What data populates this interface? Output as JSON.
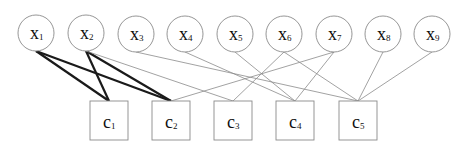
{
  "diagram": {
    "variables": [
      {
        "id": "x1",
        "label": "x",
        "sub": "1",
        "cx": 36,
        "cy": 33
      },
      {
        "id": "x2",
        "label": "x",
        "sub": "2",
        "cx": 86,
        "cy": 33
      },
      {
        "id": "x3",
        "label": "x",
        "sub": "3",
        "cx": 136,
        "cy": 34
      },
      {
        "id": "x4",
        "label": "x",
        "sub": "4",
        "cx": 185,
        "cy": 34
      },
      {
        "id": "x5",
        "label": "x",
        "sub": "5",
        "cx": 235,
        "cy": 34
      },
      {
        "id": "x6",
        "label": "x",
        "sub": "6",
        "cx": 284,
        "cy": 34
      },
      {
        "id": "x7",
        "label": "x",
        "sub": "7",
        "cx": 334,
        "cy": 34
      },
      {
        "id": "x8",
        "label": "x",
        "sub": "8",
        "cx": 383,
        "cy": 34
      },
      {
        "id": "x9",
        "label": "x",
        "sub": "9",
        "cx": 432,
        "cy": 34
      }
    ],
    "checks": [
      {
        "id": "c1",
        "label": "c",
        "sub": "1",
        "x": 90,
        "y": 101,
        "w": 38,
        "h": 39
      },
      {
        "id": "c2",
        "label": "c",
        "sub": "2",
        "x": 152,
        "y": 101,
        "w": 38,
        "h": 39
      },
      {
        "id": "c3",
        "label": "c",
        "sub": "3",
        "x": 214,
        "y": 101,
        "w": 38,
        "h": 39
      },
      {
        "id": "c4",
        "label": "c",
        "sub": "4",
        "x": 276,
        "y": 101,
        "w": 38,
        "h": 39
      },
      {
        "id": "c5",
        "label": "c",
        "sub": "5",
        "x": 339,
        "y": 101,
        "w": 38,
        "h": 39
      }
    ],
    "edges": [
      {
        "from": "x1",
        "to": "c1",
        "bold": true
      },
      {
        "from": "x1",
        "to": "c2",
        "bold": true
      },
      {
        "from": "x2",
        "to": "c1",
        "bold": true
      },
      {
        "from": "x2",
        "to": "c2",
        "bold": true
      },
      {
        "from": "x2",
        "to": "c3",
        "bold": false
      },
      {
        "from": "x3",
        "to": "c5",
        "bold": false
      },
      {
        "from": "x4",
        "to": "c4",
        "bold": false
      },
      {
        "from": "x5",
        "to": "c4",
        "bold": false
      },
      {
        "from": "x6",
        "to": "c3",
        "bold": false
      },
      {
        "from": "x6",
        "to": "c5",
        "bold": false
      },
      {
        "from": "x7",
        "to": "c2",
        "bold": false
      },
      {
        "from": "x7",
        "to": "c4",
        "bold": false
      },
      {
        "from": "x8",
        "to": "c5",
        "bold": false
      },
      {
        "from": "x9",
        "to": "c5",
        "bold": false
      }
    ],
    "style": {
      "node_stroke": "#8a8a8a",
      "thin_edge": "#8a8a8a",
      "bold_edge": "#1a1a1a",
      "radius": 18
    }
  }
}
